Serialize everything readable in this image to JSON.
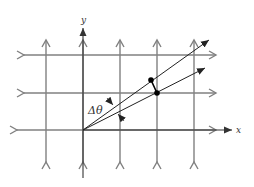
{
  "figure": {
    "axes": {
      "x_label": "x",
      "y_label": "y"
    },
    "angle_label": "Δθ",
    "grid": {
      "vertical_x": [
        46,
        83,
        120,
        157,
        194
      ],
      "horizontal_y": [
        55,
        93,
        130
      ],
      "origin": [
        83,
        130
      ]
    },
    "rays": [
      {
        "name": "upper-ray",
        "end": [
          209,
          40
        ]
      },
      {
        "name": "lower-ray",
        "end": [
          205,
          68
        ]
      }
    ],
    "points": [
      {
        "name": "point-upper",
        "at": [
          151,
          80
        ]
      },
      {
        "name": "point-lower",
        "at": [
          157,
          93
        ]
      }
    ],
    "colors": {
      "grid": "#808080",
      "axis": "#333333",
      "ray": "#222222",
      "point": "#000000"
    }
  }
}
